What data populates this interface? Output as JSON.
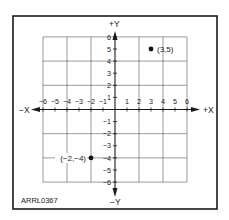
{
  "figure": {
    "id_label": "ARRL0367",
    "x_axis": {
      "positive_label": "+X",
      "negative_label": "−X",
      "min": -6,
      "max": 6
    },
    "y_axis": {
      "positive_label": "+Y",
      "negative_label": "−Y",
      "min": -6,
      "max": 6
    },
    "x_tick_labels": [
      "−6",
      "−5",
      "−4",
      "−3",
      "−2",
      "−1",
      "1",
      "2",
      "3",
      "4",
      "5",
      "6"
    ],
    "y_tick_labels": [
      "6",
      "5",
      "4",
      "3",
      "2",
      "1",
      "−1",
      "−2",
      "−3",
      "−4",
      "−5",
      "−6"
    ],
    "grid_spacing": 2,
    "points": [
      {
        "x": 3,
        "y": 5,
        "label": "(3,5)"
      },
      {
        "x": -2,
        "y": -4,
        "label": "(−2,−4)"
      }
    ]
  }
}
